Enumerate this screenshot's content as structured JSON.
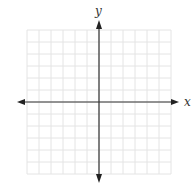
{
  "diagram": {
    "type": "cartesian-coordinate-plane",
    "grid": {
      "columns": 12,
      "rows": 12,
      "cell_size_px": 12,
      "line_color": "#e4e4e4"
    },
    "axes": {
      "color": "#333333",
      "x_label": "x",
      "y_label": "y",
      "arrows": "both-ends"
    }
  }
}
